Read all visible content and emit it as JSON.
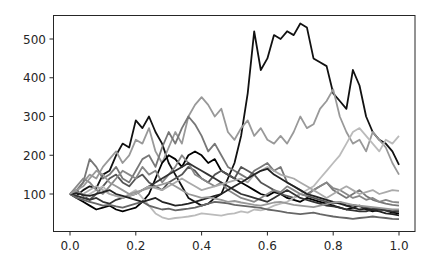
{
  "chart_data": {
    "type": "line",
    "title": "",
    "xlabel": "",
    "ylabel": "",
    "xlim": [
      -0.05,
      1.05
    ],
    "ylim": [
      5,
      560
    ],
    "grid": false,
    "legend": null,
    "xticks": [
      0.0,
      0.2,
      0.4,
      0.6,
      0.8,
      1.0
    ],
    "xtick_labels": [
      "0.0",
      "0.2",
      "0.4",
      "0.6",
      "0.8",
      "1.0"
    ],
    "yticks": [
      100,
      200,
      300,
      400,
      500
    ],
    "ytick_labels": [
      "100",
      "200",
      "300",
      "400",
      "500"
    ],
    "x": [
      0.0,
      0.02,
      0.04,
      0.06,
      0.08,
      0.1,
      0.12,
      0.14,
      0.16,
      0.18,
      0.2,
      0.22,
      0.24,
      0.26,
      0.28,
      0.3,
      0.32,
      0.34,
      0.36,
      0.38,
      0.4,
      0.42,
      0.44,
      0.46,
      0.48,
      0.5,
      0.52,
      0.54,
      0.56,
      0.58,
      0.6,
      0.62,
      0.64,
      0.66,
      0.68,
      0.7,
      0.72,
      0.74,
      0.76,
      0.78,
      0.8,
      0.82,
      0.84,
      0.86,
      0.88,
      0.9,
      0.92,
      0.94,
      0.96,
      0.98,
      1.0
    ],
    "series": [
      {
        "name": "path-1",
        "color": "#111111",
        "values": [
          100,
          95,
          110,
          120,
          115,
          150,
          160,
          200,
          230,
          220,
          290,
          270,
          300,
          260,
          230,
          180,
          150,
          120,
          90,
          80,
          70,
          75,
          90,
          100,
          140,
          180,
          250,
          360,
          520,
          420,
          450,
          510,
          500,
          520,
          510,
          540,
          530,
          450,
          440,
          430,
          360,
          340,
          320,
          420,
          380,
          300,
          260,
          240,
          230,
          210,
          175
        ]
      },
      {
        "name": "path-2",
        "color": "#999999",
        "values": [
          100,
          105,
          130,
          150,
          140,
          170,
          190,
          210,
          180,
          200,
          240,
          230,
          270,
          210,
          180,
          220,
          260,
          230,
          300,
          330,
          350,
          330,
          300,
          320,
          260,
          240,
          270,
          290,
          250,
          270,
          240,
          230,
          250,
          230,
          260,
          300,
          270,
          280,
          320,
          340,
          370,
          300,
          260,
          230,
          240,
          210,
          260,
          240,
          220,
          180,
          150
        ]
      },
      {
        "name": "path-3",
        "color": "#777777",
        "values": [
          100,
          110,
          130,
          190,
          170,
          140,
          150,
          170,
          140,
          130,
          160,
          190,
          200,
          170,
          220,
          260,
          230,
          270,
          300,
          280,
          250,
          210,
          230,
          200,
          170,
          160,
          150,
          140,
          160,
          170,
          180,
          160,
          170,
          130,
          120,
          110,
          100,
          110,
          120,
          130,
          110,
          100,
          90,
          100,
          110,
          95,
          85,
          80,
          75,
          72,
          70
        ]
      },
      {
        "name": "path-4",
        "color": "#000000",
        "values": [
          100,
          90,
          80,
          70,
          60,
          65,
          70,
          60,
          55,
          60,
          65,
          80,
          100,
          140,
          180,
          200,
          190,
          170,
          200,
          210,
          200,
          180,
          190,
          160,
          150,
          140,
          130,
          120,
          110,
          100,
          95,
          105,
          100,
          90,
          85,
          80,
          90,
          85,
          80,
          75,
          70,
          65,
          60,
          65,
          70,
          60,
          55,
          60,
          58,
          52,
          50
        ]
      },
      {
        "name": "path-5",
        "color": "#555555",
        "values": [
          100,
          110,
          95,
          85,
          100,
          120,
          140,
          150,
          130,
          120,
          140,
          150,
          130,
          120,
          110,
          130,
          140,
          150,
          170,
          160,
          140,
          130,
          150,
          160,
          150,
          140,
          170,
          160,
          150,
          130,
          120,
          110,
          100,
          95,
          90,
          100,
          95,
          90,
          85,
          80,
          75,
          80,
          70,
          72,
          68,
          65,
          62,
          60,
          58,
          55,
          55
        ]
      },
      {
        "name": "path-6",
        "color": "#bbbbbb",
        "values": [
          100,
          95,
          90,
          100,
          110,
          120,
          100,
          95,
          90,
          100,
          110,
          90,
          70,
          50,
          40,
          35,
          38,
          40,
          42,
          45,
          50,
          48,
          46,
          44,
          48,
          50,
          55,
          52,
          60,
          58,
          62,
          70,
          75,
          80,
          90,
          100,
          110,
          120,
          140,
          160,
          180,
          200,
          230,
          260,
          270,
          250,
          230,
          210,
          240,
          230,
          250
        ]
      },
      {
        "name": "path-7",
        "color": "#888888",
        "values": [
          100,
          120,
          140,
          130,
          110,
          100,
          120,
          140,
          160,
          150,
          140,
          170,
          150,
          160,
          130,
          150,
          170,
          200,
          180,
          150,
          140,
          130,
          120,
          130,
          110,
          100,
          90,
          85,
          80,
          90,
          100,
          110,
          105,
          120,
          110,
          100,
          95,
          110,
          120,
          130,
          115,
          110,
          100,
          90,
          95,
          85,
          90,
          80,
          85,
          80,
          78
        ]
      },
      {
        "name": "path-8",
        "color": "#333333",
        "values": [
          100,
          95,
          90,
          85,
          90,
          80,
          75,
          85,
          90,
          95,
          100,
          110,
          120,
          130,
          140,
          150,
          160,
          170,
          180,
          170,
          160,
          150,
          140,
          130,
          120,
          110,
          100,
          95,
          90,
          85,
          80,
          90,
          100,
          110,
          100,
          90,
          85,
          80,
          75,
          70,
          68,
          65,
          60,
          58,
          55,
          55,
          60,
          62,
          58,
          55,
          58
        ]
      },
      {
        "name": "path-9",
        "color": "#aaaaaa",
        "values": [
          100,
          105,
          100,
          110,
          120,
          110,
          100,
          95,
          90,
          95,
          100,
          110,
          120,
          115,
          110,
          120,
          130,
          140,
          130,
          120,
          110,
          115,
          120,
          125,
          130,
          135,
          140,
          130,
          150,
          160,
          170,
          160,
          150,
          145,
          140,
          130,
          120,
          110,
          100,
          90,
          100,
          110,
          120,
          110,
          100,
          105,
          110,
          100,
          105,
          110,
          108
        ]
      },
      {
        "name": "path-10",
        "color": "#666666",
        "values": [
          100,
          90,
          85,
          80,
          75,
          70,
          72,
          68,
          65,
          70,
          75,
          80,
          70,
          65,
          60,
          62,
          58,
          60,
          62,
          65,
          70,
          75,
          80,
          78,
          76,
          72,
          70,
          68,
          66,
          64,
          60,
          58,
          55,
          52,
          50,
          48,
          50,
          52,
          48,
          45,
          42,
          40,
          38,
          36,
          38,
          40,
          42,
          40,
          38,
          36,
          35
        ]
      },
      {
        "name": "path-11",
        "color": "#222222",
        "values": [
          100,
          102,
          98,
          95,
          100,
          105,
          110,
          100,
          95,
          90,
          85,
          80,
          85,
          90,
          80,
          75,
          70,
          72,
          75,
          80,
          85,
          90,
          95,
          100,
          110,
          120,
          130,
          140,
          150,
          160,
          165,
          150,
          140,
          130,
          120,
          110,
          100,
          95,
          90,
          85,
          80,
          75,
          70,
          65,
          60,
          62,
          58,
          55,
          50,
          48,
          45
        ]
      },
      {
        "name": "path-12",
        "color": "#999999",
        "values": [
          100,
          110,
          120,
          140,
          160,
          150,
          130,
          120,
          110,
          100,
          105,
          110,
          115,
          120,
          125,
          130,
          120,
          110,
          100,
          95,
          90,
          92,
          88,
          85,
          80,
          82,
          78,
          75,
          72,
          70,
          74,
          78,
          80,
          76,
          72,
          70,
          68,
          66,
          70,
          74,
          78,
          80,
          76,
          72,
          70,
          68,
          66,
          64,
          62,
          60,
          60
        ]
      }
    ]
  }
}
